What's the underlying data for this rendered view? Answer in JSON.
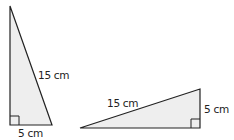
{
  "diagram": {
    "triangles": [
      {
        "name": "tall-triangle",
        "hypotenuse_label": "15 cm",
        "base_label": "5 cm",
        "right_angle": "bottom-left"
      },
      {
        "name": "wide-triangle",
        "hypotenuse_label": "15 cm",
        "side_label": "5 cm",
        "right_angle": "bottom-right"
      }
    ],
    "colors": {
      "stroke": "#222222",
      "fill": "#eeeeee"
    }
  }
}
